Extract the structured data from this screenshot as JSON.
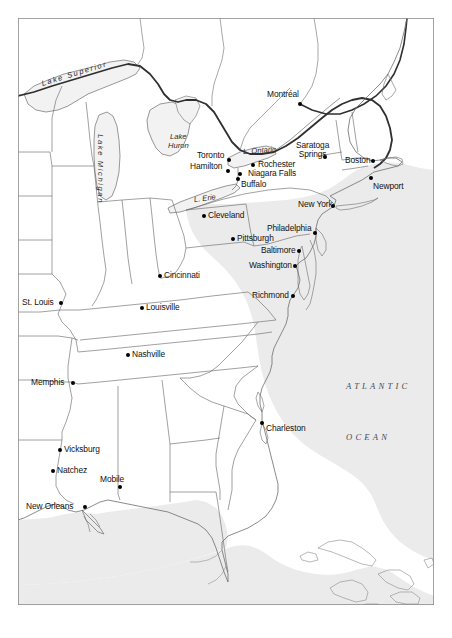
{
  "map": {
    "title": "Eastern North America Historical Reference Map",
    "frame": {
      "border_color": "#8d8d8d",
      "background": "#ffffff"
    },
    "palette": {
      "land": "#ffffff",
      "ocean": "#ebebeb",
      "lake": "#f2f2f2",
      "state_border": "#6d6d6d",
      "national_border": "#303030",
      "coastline": "#6d6d6d",
      "dot": "#000000",
      "text": "#111111",
      "ocean_text": "#4a4a56"
    },
    "cities": [
      {
        "name": "Montréal",
        "x": 300,
        "y": 104,
        "label_x": 267,
        "label_y": 90,
        "align": "left"
      },
      {
        "name": "Toronto",
        "x": 229,
        "y": 160,
        "label_x": 197,
        "label_y": 151,
        "align": "left"
      },
      {
        "name": "Hamilton",
        "x": 228,
        "y": 171,
        "label_x": 190,
        "label_y": 162,
        "align": "left"
      },
      {
        "name": "Rochester",
        "x": 253,
        "y": 165,
        "label_x": 258,
        "label_y": 160,
        "align": "left"
      },
      {
        "name": "Niagara Falls",
        "x": 240,
        "y": 174,
        "label_x": 248,
        "label_y": 169,
        "align": "left"
      },
      {
        "name": "Buffalo",
        "x": 238,
        "y": 179,
        "label_x": 241,
        "label_y": 180,
        "align": "left"
      },
      {
        "name": "Saratoga Springs",
        "x": 325,
        "y": 157,
        "label_x": 296,
        "label_y": 141,
        "align": "center",
        "two_line": true
      },
      {
        "name": "Boston",
        "x": 373,
        "y": 161,
        "label_x": 345,
        "label_y": 156,
        "align": "left"
      },
      {
        "name": "Newport",
        "x": 371,
        "y": 178,
        "label_x": 373,
        "label_y": 182,
        "align": "left"
      },
      {
        "name": "New York",
        "x": 333,
        "y": 206,
        "label_x": 298,
        "label_y": 200,
        "align": "left"
      },
      {
        "name": "Cleveland",
        "x": 204,
        "y": 216,
        "label_x": 208,
        "label_y": 211,
        "align": "left"
      },
      {
        "name": "Philadelphia",
        "x": 315,
        "y": 233,
        "label_x": 267,
        "label_y": 224,
        "align": "left"
      },
      {
        "name": "Pittsburgh",
        "x": 233,
        "y": 239,
        "label_x": 237,
        "label_y": 234,
        "align": "left"
      },
      {
        "name": "Baltimore",
        "x": 299,
        "y": 251,
        "label_x": 261,
        "label_y": 246,
        "align": "left"
      },
      {
        "name": "Washington",
        "x": 295,
        "y": 266,
        "label_x": 249,
        "label_y": 261,
        "align": "left"
      },
      {
        "name": "Cincinnati",
        "x": 160,
        "y": 276,
        "label_x": 164,
        "label_y": 271,
        "align": "left"
      },
      {
        "name": "Richmond",
        "x": 293,
        "y": 296,
        "label_x": 252,
        "label_y": 291,
        "align": "left"
      },
      {
        "name": "St. Louis",
        "x": 61,
        "y": 303,
        "label_x": 22,
        "label_y": 298,
        "align": "left"
      },
      {
        "name": "Louisville",
        "x": 142,
        "y": 308,
        "label_x": 146,
        "label_y": 303,
        "align": "left"
      },
      {
        "name": "Nashville",
        "x": 128,
        "y": 355,
        "label_x": 132,
        "label_y": 350,
        "align": "left"
      },
      {
        "name": "Memphis",
        "x": 73,
        "y": 383,
        "label_x": 31,
        "label_y": 378,
        "align": "left"
      },
      {
        "name": "Charleston",
        "x": 262,
        "y": 423,
        "label_x": 266,
        "label_y": 424,
        "align": "left"
      },
      {
        "name": "Vicksburg",
        "x": 60,
        "y": 450,
        "label_x": 64,
        "label_y": 445,
        "align": "left"
      },
      {
        "name": "Natchez",
        "x": 53,
        "y": 471,
        "label_x": 57,
        "label_y": 466,
        "align": "left"
      },
      {
        "name": "Mobile",
        "x": 120,
        "y": 487,
        "label_x": 100,
        "label_y": 475,
        "align": "left"
      },
      {
        "name": "New Orleans",
        "x": 85,
        "y": 507,
        "label_x": 26,
        "label_y": 502,
        "align": "left"
      }
    ],
    "water_labels": [
      {
        "name": "Lake Superior",
        "x": 42,
        "y": 80,
        "rotate": -17,
        "spaced": true
      },
      {
        "name": "Lake Michigan",
        "x": 100,
        "y": 130,
        "rotate": 90,
        "spaced": true
      },
      {
        "name": "Lake",
        "x": 170,
        "y": 133,
        "rotate": 0,
        "spaced": false
      },
      {
        "name": "Huron",
        "x": 168,
        "y": 142,
        "rotate": 0,
        "spaced": false
      },
      {
        "name": "L. Ontario",
        "x": 243,
        "y": 148,
        "rotate": -4,
        "spaced": false
      },
      {
        "name": "L. Erie",
        "x": 194,
        "y": 196,
        "rotate": -7,
        "spaced": false
      }
    ],
    "ocean_labels": [
      {
        "name": "ATLANTIC",
        "x": 346,
        "y": 381
      },
      {
        "name": "OCEAN",
        "x": 346,
        "y": 432
      }
    ]
  }
}
